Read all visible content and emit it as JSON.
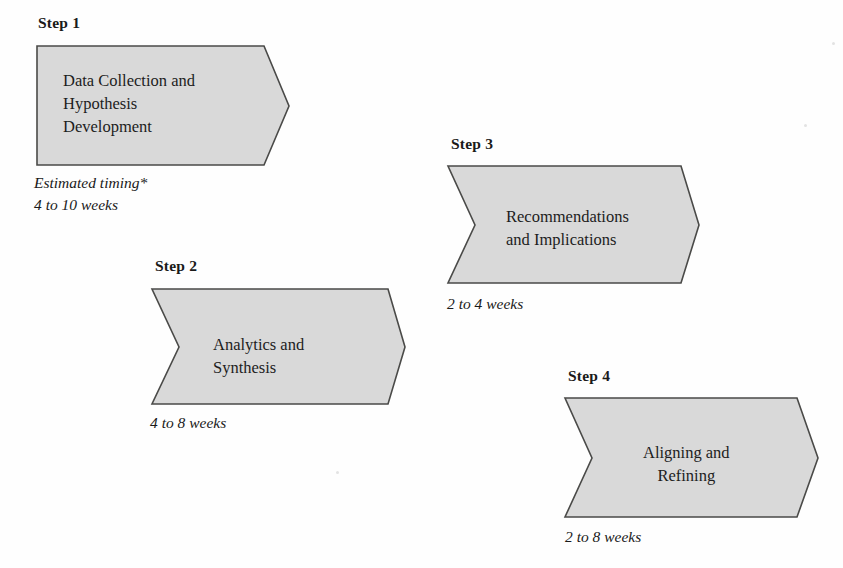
{
  "diagram": {
    "title_visible": false,
    "palette": {
      "shape_fill": "#d9d9d9",
      "shape_border": "#4a4a48",
      "text": "#1d1d1d",
      "background": "#fefefe"
    },
    "footnote_marker": "*",
    "timing_caption_label": "Estimated timing*",
    "steps": [
      {
        "step_label": "Step 1",
        "body_line_1": "Data Collection and",
        "body_line_2": "Hypothesis",
        "body_line_3": "Development",
        "timing_caption": "Estimated timing*",
        "timing": "4 to 10 weeks",
        "has_left_notch": false
      },
      {
        "step_label": "Step 2",
        "body_line_1": "Analytics and",
        "body_line_2": "Synthesis",
        "body_line_3": "",
        "timing_caption": "",
        "timing": "4 to 8 weeks",
        "has_left_notch": true
      },
      {
        "step_label": "Step 3",
        "body_line_1": "Recommendations",
        "body_line_2": "and Implications",
        "body_line_3": "",
        "timing_caption": "",
        "timing": "2 to 4 weeks",
        "has_left_notch": true
      },
      {
        "step_label": "Step 4",
        "body_line_1": "Aligning and",
        "body_line_2": "Refining",
        "body_line_3": "",
        "timing_caption": "",
        "timing": "2 to 8 weeks",
        "has_left_notch": true
      }
    ]
  }
}
